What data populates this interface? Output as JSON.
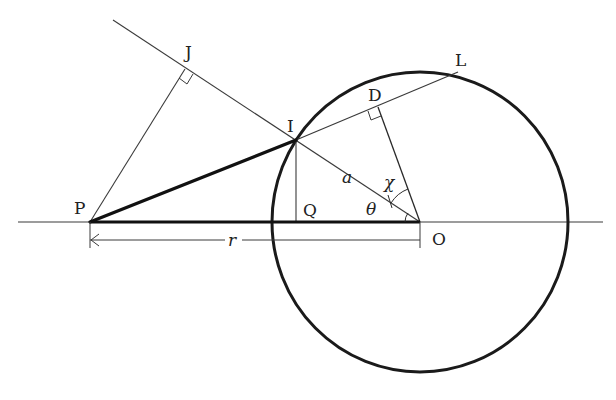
{
  "diagram": {
    "type": "geometry",
    "colors": {
      "stroke": "#1a1a1a",
      "thin_stroke": "#3a3a3a",
      "background": "#ffffff"
    },
    "circle": {
      "center_label": "O",
      "cx": 420,
      "cy": 222,
      "rx": 148,
      "ry": 150
    },
    "points": {
      "P": {
        "label": "P",
        "x": 90,
        "y": 222
      },
      "O": {
        "label": "O",
        "x": 420,
        "y": 222
      },
      "I": {
        "label": "I",
        "x": 296,
        "y": 140
      },
      "Q": {
        "label": "Q",
        "x": 296,
        "y": 222
      },
      "D": {
        "label": "D",
        "x": 378,
        "y": 107
      },
      "L": {
        "label": "L",
        "x": 458,
        "y": 72
      },
      "J": {
        "label": "J",
        "x": 185,
        "y": 69
      }
    },
    "symbols": {
      "a": "a",
      "chi": "χ",
      "theta": "θ",
      "r": "r"
    },
    "segments": [
      {
        "from": "P",
        "to": "O",
        "style": "thick"
      },
      {
        "from": "P",
        "to": "I",
        "style": "thick"
      },
      {
        "from": "I",
        "to": "L",
        "style": "thin"
      },
      {
        "from": "O",
        "to": "D",
        "style": "thin"
      },
      {
        "from": "I",
        "to": "Q",
        "style": "thin"
      },
      {
        "from": "P",
        "to": "J",
        "style": "thin"
      },
      {
        "from": "J-extension",
        "to": "O",
        "style": "thin"
      },
      {
        "from": "axis-left",
        "to": "axis-right",
        "style": "thin"
      }
    ],
    "dimension": {
      "label": "r",
      "from": "P",
      "to": "O"
    },
    "right_angles": [
      "J",
      "D"
    ],
    "angles": [
      {
        "label": "θ",
        "vertex": "O",
        "between": [
          "OP",
          "OI"
        ]
      },
      {
        "label": "χ",
        "vertex": "O",
        "between": [
          "OI",
          "OD"
        ]
      }
    ]
  }
}
